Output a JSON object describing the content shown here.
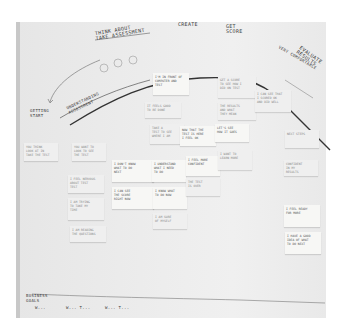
{
  "scene": {
    "description": "Photo of a whiteboard customer journey map with handwritten stage labels, a curved emotion line and sticky notes"
  },
  "headings": {
    "think_about": "THINK ABOUT\nTAKE ASSESSMENT",
    "getting_start": "GETTING\nSTART",
    "understanding": "UNDERSTANDING\nASSESSMENT",
    "create": "CREATE",
    "get_score": "GET\nSCORE",
    "evaluate": "EVALUATE\nRESULTS",
    "very_comfortable": "VERY COMFORTABLE"
  },
  "notes": [
    {
      "text": "YOU THINK\nLOOK AT IN\nTAKE THE TEST"
    },
    {
      "text": "YOU WANT TO\nLOOK TO SEE\nTHE TEST"
    },
    {
      "text": "I FEEL NERVOUS\nABOUT TEST\nTEST"
    },
    {
      "text": "I AM TRYING\nTO TAKE MY\nTIME"
    },
    {
      "text": "I AM READING\nTHE QUESTIONS"
    },
    {
      "text": "TAKE A\nTEST TO SEE\nWHERE I AM"
    },
    {
      "text": "NOW THAT THE\nTEST IS HERE\nI FEEL OK"
    },
    {
      "text": "LET'S SEE\nHOW IT GOES"
    },
    {
      "text": "GET A SCORE\nTO SEE HOW I\nDID ON TEST"
    },
    {
      "text": "THE RESULTS\nAND WHAT\nTHEY MEAN"
    },
    {
      "text": "I CAN SEE THAT\nI SCORED OK\nAND DID WELL"
    },
    {
      "text": "I'M IN FRONT OF\nCOMPUTER AND\nTEST"
    },
    {
      "text": "IT FEELS GOOD\nTO BE DONE"
    },
    {
      "text": "I DON'T KNOW\nWHAT TO DO\nNEXT"
    },
    {
      "text": "I CAN SEE\nTHE SCORE\nRIGHT NOW"
    },
    {
      "text": "I UNDERSTAND\nWHAT I NEED\nTO DO"
    },
    {
      "text": "I KNOW WHAT\nTO DO NOW"
    },
    {
      "text": "I AM SURE\nOF MYSELF"
    },
    {
      "text": "I FEEL MORE\nCONFIDENT"
    },
    {
      "text": "THE TEST\nIS OVER"
    },
    {
      "text": "I WANT TO\nLEARN MORE"
    },
    {
      "text": "NEXT STEPS"
    },
    {
      "text": "CONFIDENT\nIN MY\nRESULTS"
    },
    {
      "text": "I FEEL READY\nFOR MORE"
    },
    {
      "text": "I HAVE A GOOD\nIDEA OF WHAT\nTO DO NEXT"
    }
  ],
  "footer": {
    "section_label": "BUSINESS\nGOALS",
    "items": [
      "W...",
      "W... T...",
      "W... T..."
    ]
  },
  "colors": {
    "board": "#e9e9e9",
    "note": "#f7f7f5",
    "ink": "#333333"
  }
}
